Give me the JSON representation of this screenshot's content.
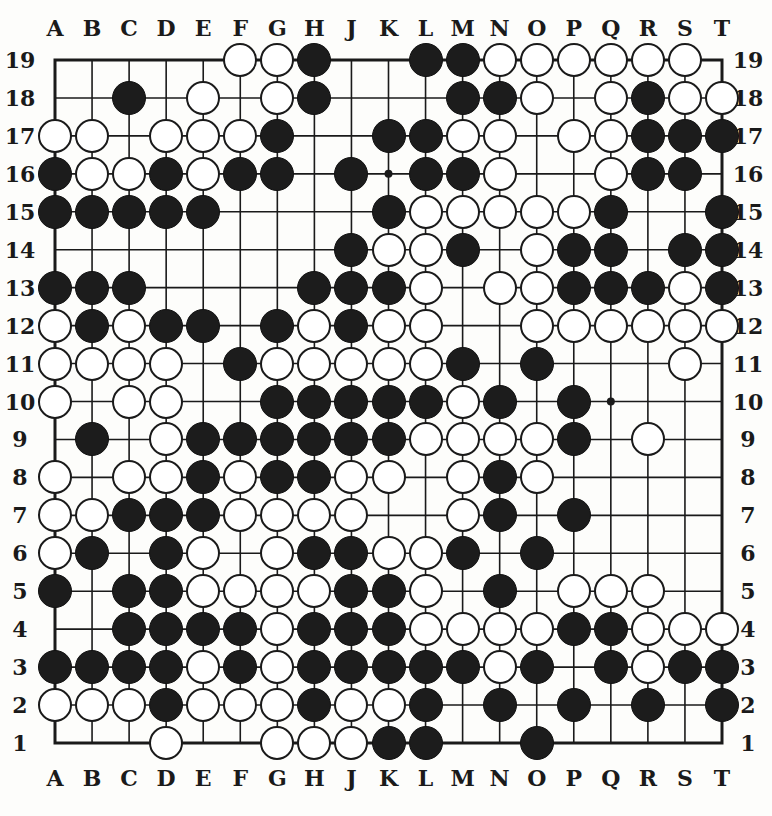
{
  "diagram": {
    "type": "go-board",
    "size": 19,
    "columns": [
      "A",
      "B",
      "C",
      "D",
      "E",
      "F",
      "G",
      "H",
      "J",
      "K",
      "L",
      "M",
      "N",
      "O",
      "P",
      "Q",
      "R",
      "S",
      "T"
    ],
    "rows": [
      19,
      18,
      17,
      16,
      15,
      14,
      13,
      12,
      11,
      10,
      9,
      8,
      7,
      6,
      5,
      4,
      3,
      2,
      1
    ],
    "colors": {
      "black": "#1c1c1c",
      "white": "#ffffff",
      "line": "#1a1a1a",
      "paper": "#fdfdfb"
    },
    "hoshi": [
      "K16",
      "Q10"
    ],
    "stones": {
      "19": {
        "F": "W",
        "G": "W",
        "H": "B",
        "L": "B",
        "M": "B",
        "N": "W",
        "O": "W",
        "P": "W",
        "Q": "W",
        "R": "W",
        "S": "W"
      },
      "18": {
        "C": "B",
        "E": "W",
        "G": "W",
        "H": "B",
        "M": "B",
        "N": "B",
        "O": "W",
        "Q": "W",
        "R": "B",
        "S": "W",
        "T": "W"
      },
      "17": {
        "A": "W",
        "B": "W",
        "D": "W",
        "E": "W",
        "F": "W",
        "G": "B",
        "K": "B",
        "L": "B",
        "M": "W",
        "N": "W",
        "P": "W",
        "Q": "W",
        "R": "B",
        "S": "B",
        "T": "B"
      },
      "16": {
        "A": "B",
        "B": "W",
        "C": "W",
        "D": "B",
        "E": "W",
        "F": "B",
        "G": "B",
        "J": "B",
        "L": "B",
        "M": "B",
        "N": "W",
        "Q": "W",
        "R": "B",
        "S": "B"
      },
      "15": {
        "A": "B",
        "B": "B",
        "C": "B",
        "D": "B",
        "E": "B",
        "K": "B",
        "L": "W",
        "M": "W",
        "N": "W",
        "O": "W",
        "P": "W",
        "Q": "B",
        "T": "B"
      },
      "14": {
        "J": "B",
        "K": "W",
        "L": "W",
        "M": "B",
        "O": "W",
        "P": "B",
        "Q": "B",
        "S": "B",
        "T": "B"
      },
      "13": {
        "A": "B",
        "B": "B",
        "C": "B",
        "H": "B",
        "J": "B",
        "K": "B",
        "L": "W",
        "N": "W",
        "O": "W",
        "P": "B",
        "Q": "B",
        "R": "B",
        "S": "W",
        "T": "B"
      },
      "12": {
        "A": "W",
        "B": "B",
        "C": "W",
        "D": "B",
        "E": "B",
        "G": "B",
        "H": "W",
        "J": "B",
        "K": "W",
        "L": "W",
        "O": "W",
        "P": "W",
        "Q": "W",
        "R": "W",
        "S": "W",
        "T": "W"
      },
      "11": {
        "A": "W",
        "B": "W",
        "C": "W",
        "D": "W",
        "F": "B",
        "G": "W",
        "H": "W",
        "J": "W",
        "K": "W",
        "L": "W",
        "M": "B",
        "O": "B",
        "S": "W"
      },
      "10": {
        "A": "W",
        "C": "W",
        "D": "W",
        "G": "B",
        "H": "B",
        "J": "B",
        "K": "B",
        "L": "B",
        "M": "W",
        "N": "B",
        "P": "B"
      },
      "9": {
        "B": "B",
        "D": "W",
        "E": "B",
        "F": "B",
        "G": "B",
        "H": "B",
        "J": "B",
        "K": "B",
        "L": "W",
        "M": "W",
        "N": "W",
        "O": "W",
        "P": "B",
        "R": "W"
      },
      "8": {
        "A": "W",
        "C": "W",
        "D": "W",
        "E": "B",
        "F": "W",
        "G": "B",
        "H": "B",
        "J": "W",
        "K": "W",
        "M": "W",
        "N": "B",
        "O": "W"
      },
      "7": {
        "A": "W",
        "B": "W",
        "C": "B",
        "D": "B",
        "E": "B",
        "F": "W",
        "G": "W",
        "H": "W",
        "J": "W",
        "M": "W",
        "N": "B",
        "P": "B"
      },
      "6": {
        "A": "W",
        "B": "B",
        "D": "B",
        "E": "W",
        "G": "W",
        "H": "B",
        "J": "B",
        "K": "W",
        "L": "W",
        "M": "B",
        "O": "B"
      },
      "5": {
        "A": "B",
        "C": "B",
        "D": "B",
        "E": "W",
        "F": "W",
        "G": "W",
        "H": "W",
        "J": "B",
        "K": "B",
        "L": "W",
        "N": "B",
        "P": "W",
        "Q": "W",
        "R": "W"
      },
      "4": {
        "C": "B",
        "D": "B",
        "E": "B",
        "F": "B",
        "G": "W",
        "H": "B",
        "J": "B",
        "K": "B",
        "L": "W",
        "M": "W",
        "N": "W",
        "O": "W",
        "P": "B",
        "Q": "B",
        "R": "W",
        "S": "W",
        "T": "W"
      },
      "3": {
        "A": "B",
        "B": "B",
        "C": "B",
        "D": "B",
        "E": "W",
        "F": "B",
        "G": "W",
        "H": "B",
        "J": "B",
        "K": "B",
        "L": "B",
        "M": "B",
        "N": "W",
        "O": "B",
        "Q": "B",
        "R": "W",
        "S": "B",
        "T": "B"
      },
      "2": {
        "A": "W",
        "B": "W",
        "C": "W",
        "D": "B",
        "E": "W",
        "F": "W",
        "G": "W",
        "H": "B",
        "J": "W",
        "K": "W",
        "L": "B",
        "N": "B",
        "P": "B",
        "R": "B",
        "T": "B"
      },
      "1": {
        "D": "W",
        "G": "W",
        "H": "W",
        "J": "W",
        "K": "B",
        "L": "B",
        "O": "B"
      }
    }
  }
}
